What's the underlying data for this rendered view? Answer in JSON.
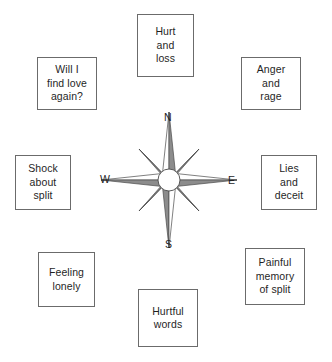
{
  "diagram": {
    "type": "compass-rose-concept-map",
    "center": {
      "name": "compass-rose",
      "cardinals": {
        "north": "N",
        "east": "E",
        "south": "S",
        "west": "W"
      },
      "points": 8,
      "colors": {
        "outline": "#4a4a4a",
        "light_face": "#ffffff",
        "dark_face": "#8c8c8c",
        "hub_fill": "#ffffff"
      }
    },
    "nodes": [
      {
        "id": "north",
        "label": "Hurt\nand\nloss"
      },
      {
        "id": "northwest",
        "label": "Will I\nfind love\nagain?"
      },
      {
        "id": "northeast",
        "label": "Anger\nand\nrage"
      },
      {
        "id": "west",
        "label": "Shock\nabout\nsplit"
      },
      {
        "id": "east",
        "label": "Lies\nand\ndeceit"
      },
      {
        "id": "southwest",
        "label": "Feeling\nlonely"
      },
      {
        "id": "southeast",
        "label": "Painful\nmemory\nof split"
      },
      {
        "id": "south",
        "label": "Hurtful\nwords"
      }
    ],
    "caption": ""
  },
  "colors": {
    "box_border": "#6b6b6b",
    "text": "#1f1f1f",
    "background": "#ffffff"
  }
}
